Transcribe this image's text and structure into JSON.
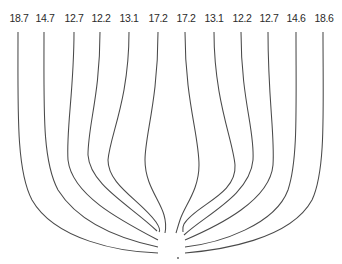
{
  "diagram": {
    "type": "streamline-convergence",
    "line_color": "#4a4a4a",
    "labels": [
      {
        "value": "18.7",
        "x": 19
      },
      {
        "value": "14.7",
        "x": 45
      },
      {
        "value": "12.7",
        "x": 74
      },
      {
        "value": "12.2",
        "x": 101
      },
      {
        "value": "13.1",
        "x": 129
      },
      {
        "value": "17.2",
        "x": 158
      },
      {
        "value": "17.2",
        "x": 186
      },
      {
        "value": "13.1",
        "x": 214
      },
      {
        "value": "12.2",
        "x": 242
      },
      {
        "value": "12.7",
        "x": 269
      },
      {
        "value": "14.6",
        "x": 296
      },
      {
        "value": "18.6",
        "x": 324
      }
    ],
    "convergence_point": {
      "x": 178,
      "y": 258
    }
  }
}
